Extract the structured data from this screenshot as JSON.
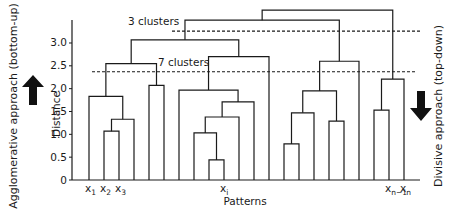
{
  "diagram": {
    "type": "dendrogram",
    "y_axis": {
      "label": "Distance",
      "ticks": [
        "0",
        "0.5",
        "1.0",
        "1.5",
        "2.0",
        "2.5",
        "3.0"
      ],
      "tick_values": [
        0,
        0.5,
        1.0,
        1.5,
        2.0,
        2.5,
        3.0
      ],
      "range": [
        0,
        3.75
      ]
    },
    "x_axis": {
      "label": "Patterns",
      "leaf_count": 22,
      "leaf_labels": [
        {
          "index": 0,
          "base": "x",
          "sub": "1"
        },
        {
          "index": 1,
          "base": "x",
          "sub": "2"
        },
        {
          "index": 2,
          "base": "x",
          "sub": "3"
        },
        {
          "index": 9,
          "base": "x",
          "sub": "i"
        },
        {
          "index": 20,
          "base": "x",
          "sub": "n−1"
        },
        {
          "index": 21,
          "base": "x",
          "sub": "n"
        }
      ]
    },
    "cut_lines": [
      {
        "label": "3 clusters",
        "height": 3.26
      },
      {
        "label": "7 clusters",
        "height": 2.37
      }
    ],
    "merges": [
      {
        "left": 1,
        "right": 2,
        "height": 1.07
      },
      {
        "left": "m0",
        "right": 3,
        "height": 1.33
      },
      {
        "left": 0,
        "right": "m1",
        "height": 1.83
      },
      {
        "left": 4,
        "right": 5,
        "height": 2.07
      },
      {
        "left": "m2",
        "right": "m3",
        "height": 2.55
      },
      {
        "left": 8,
        "right": 9,
        "height": 0.44
      },
      {
        "left": 7,
        "right": "m5",
        "height": 1.03
      },
      {
        "left": "m6",
        "right": 10,
        "height": 1.38
      },
      {
        "left": "m7",
        "right": 11,
        "height": 1.71
      },
      {
        "left": 6,
        "right": "m8",
        "height": 1.97
      },
      {
        "left": "m9",
        "right": 12,
        "height": 2.7
      },
      {
        "left": "m4",
        "right": "m10",
        "height": 3.07
      },
      {
        "left": 13,
        "right": 14,
        "height": 0.79
      },
      {
        "left": "m12",
        "right": 15,
        "height": 1.47
      },
      {
        "left": 16,
        "right": 17,
        "height": 1.29
      },
      {
        "left": "m13",
        "right": "m14",
        "height": 1.95
      },
      {
        "left": "m15",
        "right": 18,
        "height": 2.6
      },
      {
        "left": "m11",
        "right": "m16",
        "height": 3.5
      },
      {
        "left": 19,
        "right": 20,
        "height": 1.53
      },
      {
        "left": "m18",
        "right": 21,
        "height": 2.21
      },
      {
        "left": "m17",
        "right": "m19",
        "height": 3.72
      }
    ],
    "side_labels": {
      "left": "Agglomerative approach (bottom-up)",
      "right": "Divisive approach (top-down)"
    },
    "arrows": {
      "left": "arrow-up",
      "right": "arrow-down"
    },
    "colors": {
      "line": "#1a1a1a",
      "background": "#ffffff"
    }
  }
}
